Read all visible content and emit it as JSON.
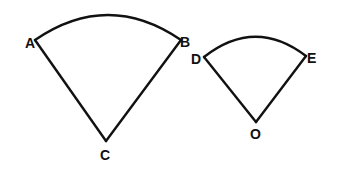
{
  "diagram": {
    "type": "geometry-sectors",
    "stroke_color": "#111111",
    "background": "#ffffff",
    "figures": [
      {
        "name": "large-sector",
        "center_label": "C",
        "arc_start_label": "A",
        "arc_end_label": "B"
      },
      {
        "name": "small-sector",
        "center_label": "O",
        "arc_start_label": "D",
        "arc_end_label": "E"
      }
    ]
  }
}
